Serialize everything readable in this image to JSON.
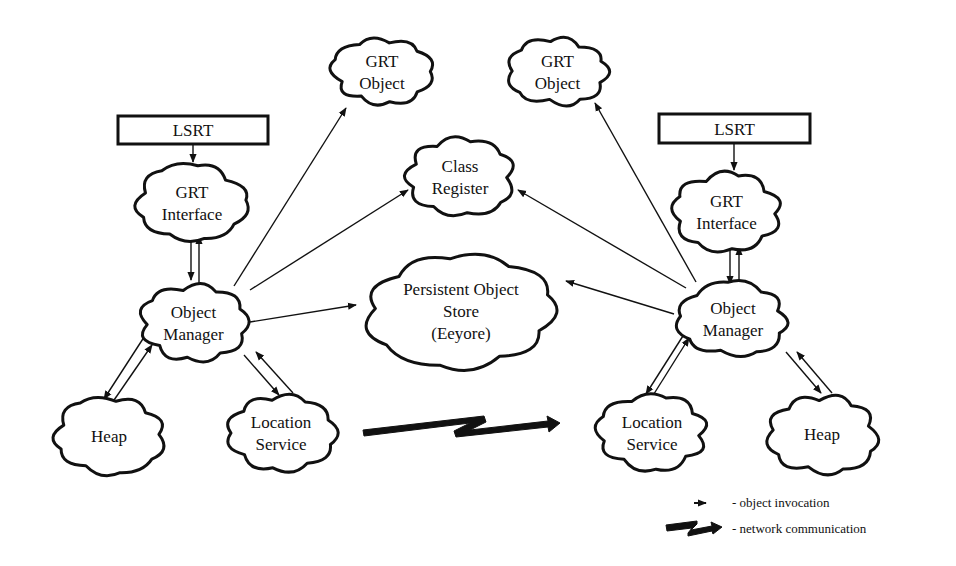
{
  "diagram": {
    "nodes": {
      "lsrt_left": {
        "label": [
          "LSRT"
        ]
      },
      "grt_interface_left": {
        "label": [
          "GRT",
          "Interface"
        ]
      },
      "object_manager_left": {
        "label": [
          "Object",
          "Manager"
        ]
      },
      "heap_left": {
        "label": [
          "Heap"
        ]
      },
      "location_service_left": {
        "label": [
          "Location",
          "Service"
        ]
      },
      "grt_object_left": {
        "label": [
          "GRT",
          "Object"
        ]
      },
      "grt_object_right": {
        "label": [
          "GRT",
          "Object"
        ]
      },
      "class_register": {
        "label": [
          "Class",
          "Register"
        ]
      },
      "persistent_store": {
        "label": [
          "Persistent Object",
          "Store",
          "(Eeyore)"
        ]
      },
      "lsrt_right": {
        "label": [
          "LSRT"
        ]
      },
      "grt_interface_right": {
        "label": [
          "GRT",
          "Interface"
        ]
      },
      "object_manager_right": {
        "label": [
          "Object",
          "Manager"
        ]
      },
      "location_service_right": {
        "label": [
          "Location",
          "Service"
        ]
      },
      "heap_right": {
        "label": [
          "Heap"
        ]
      }
    },
    "edges": [
      {
        "from": "lsrt_left",
        "to": "grt_interface_left",
        "type": "object invocation"
      },
      {
        "from": "grt_interface_left",
        "to": "object_manager_left",
        "type": "object invocation"
      },
      {
        "from": "object_manager_left",
        "to": "grt_interface_left",
        "type": "object invocation"
      },
      {
        "from": "object_manager_left",
        "to": "grt_object_left",
        "type": "object invocation"
      },
      {
        "from": "object_manager_left",
        "to": "class_register",
        "type": "object invocation"
      },
      {
        "from": "object_manager_left",
        "to": "persistent_store",
        "type": "object invocation"
      },
      {
        "from": "object_manager_left",
        "to": "heap_left",
        "type": "object invocation"
      },
      {
        "from": "heap_left",
        "to": "object_manager_left",
        "type": "object invocation"
      },
      {
        "from": "object_manager_left",
        "to": "location_service_left",
        "type": "object invocation"
      },
      {
        "from": "location_service_left",
        "to": "object_manager_left",
        "type": "object invocation"
      },
      {
        "from": "location_service_left",
        "to": "location_service_right",
        "type": "network communication"
      },
      {
        "from": "lsrt_right",
        "to": "grt_interface_right",
        "type": "object invocation"
      },
      {
        "from": "grt_interface_right",
        "to": "object_manager_right",
        "type": "object invocation"
      },
      {
        "from": "object_manager_right",
        "to": "grt_interface_right",
        "type": "object invocation"
      },
      {
        "from": "object_manager_right",
        "to": "grt_object_right",
        "type": "object invocation"
      },
      {
        "from": "object_manager_right",
        "to": "class_register",
        "type": "object invocation"
      },
      {
        "from": "object_manager_right",
        "to": "persistent_store",
        "type": "object invocation"
      },
      {
        "from": "object_manager_right",
        "to": "location_service_right",
        "type": "object invocation"
      },
      {
        "from": "location_service_right",
        "to": "object_manager_right",
        "type": "object invocation"
      },
      {
        "from": "object_manager_right",
        "to": "heap_right",
        "type": "object invocation"
      },
      {
        "from": "heap_right",
        "to": "object_manager_right",
        "type": "object invocation"
      }
    ]
  },
  "legend": {
    "object_invocation": "- object invocation",
    "network_communication": "- network communication"
  }
}
